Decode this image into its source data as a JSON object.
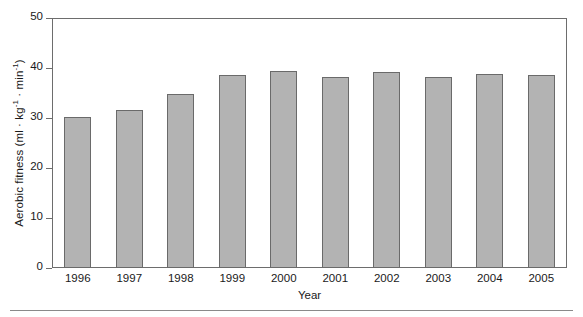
{
  "chart_data": {
    "type": "bar",
    "title": "",
    "xlabel": "Year",
    "ylabel": "Aerobic fitness (ml · kg⁻¹ · min⁻¹)",
    "ylabel_parts": {
      "prefix": "Aerobic fitness (ml · kg",
      "sup1": "-1",
      "middle": " · min",
      "sup2": "-1",
      "suffix": ")"
    },
    "categories": [
      "1996",
      "1997",
      "1998",
      "1999",
      "2000",
      "2001",
      "2002",
      "2003",
      "2004",
      "2005"
    ],
    "values": [
      30.2,
      31.6,
      34.8,
      38.6,
      39.4,
      38.2,
      39.3,
      38.2,
      38.8,
      38.7
    ],
    "ylim": [
      0,
      50
    ],
    "yticks": [
      0,
      10,
      20,
      30,
      40,
      50
    ],
    "ytick_labels": [
      "0",
      "10",
      "20",
      "30",
      "40",
      "50"
    ],
    "grid": false,
    "legend": null,
    "bar_color": "#b3b3b3",
    "bar_edge_color": "#6a6a6a",
    "axis_color": "#6d6d6d",
    "text_color": "#1a1a1a"
  }
}
